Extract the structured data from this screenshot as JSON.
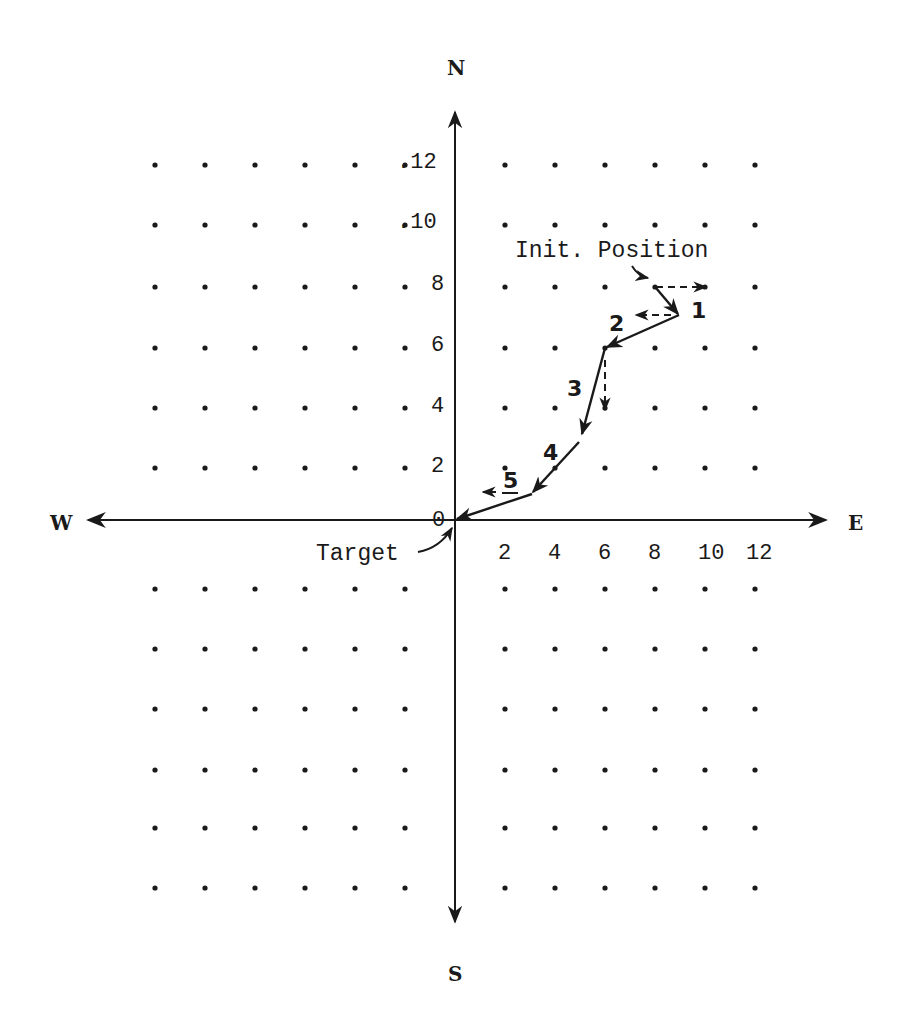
{
  "compass": {
    "north": "N",
    "south": "S",
    "east": "E",
    "west": "W"
  },
  "annotations": {
    "init_position": "Init. Position",
    "target": "Target"
  },
  "x_ticks": [
    "2",
    "4",
    "6",
    "8",
    "10",
    "12"
  ],
  "y_ticks": [
    ".12",
    ".10",
    "8",
    "6",
    "4",
    "2",
    "0"
  ],
  "steps": [
    "1",
    "2",
    "3",
    "4",
    "5"
  ],
  "colors": {
    "ink": "#1a1a1a",
    "background": "#ffffff"
  },
  "chart_data": {
    "type": "diagram",
    "title": "",
    "axes": {
      "horizontal": {
        "negative_label": "W",
        "positive_label": "E",
        "ticks": [
          2,
          4,
          6,
          8,
          10,
          12
        ]
      },
      "vertical": {
        "negative_label": "S",
        "positive_label": "N",
        "ticks": [
          0,
          2,
          4,
          6,
          8,
          10,
          12
        ]
      }
    },
    "grid": {
      "type": "dots",
      "spacing": 2,
      "x_range": [
        -12,
        12
      ],
      "y_range": [
        -12,
        12
      ]
    },
    "path": {
      "start_label": "Init. Position",
      "end_label": "Target",
      "points": [
        {
          "label": "Init",
          "x": 8,
          "y": 8
        },
        {
          "label": "1",
          "x": 9,
          "y": 7
        },
        {
          "label": "2",
          "x": 6,
          "y": 6
        },
        {
          "label": "3",
          "x": 5,
          "y": 3
        },
        {
          "label": "4",
          "x": 3,
          "y": 1
        },
        {
          "label": "5 / Target",
          "x": 0,
          "y": 0
        }
      ],
      "dashed_vectors": [
        {
          "from": [
            8,
            8
          ],
          "to": [
            10,
            8
          ],
          "direction": "E"
        },
        {
          "from": [
            8.7,
            7
          ],
          "to": [
            7.3,
            7
          ],
          "direction": "W"
        },
        {
          "from": [
            6,
            5.8
          ],
          "to": [
            6,
            3.7
          ],
          "direction": "S"
        },
        {
          "from": [
            1.8,
            1
          ],
          "to": [
            1.2,
            1
          ],
          "direction": "W"
        }
      ]
    }
  }
}
